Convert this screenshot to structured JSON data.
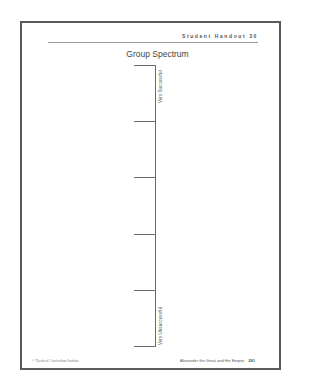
{
  "header": {
    "handout_label": "Student Handout 30"
  },
  "title": "Group Spectrum",
  "spectrum": {
    "top_label": "Very Successful",
    "bottom_label": "Very Unsuccessful",
    "tick_count": 6
  },
  "footer": {
    "copyright": "© Teachers' Curriculum Institute",
    "book_title": "Alexander the Great and His Empire",
    "page_number": "281"
  }
}
